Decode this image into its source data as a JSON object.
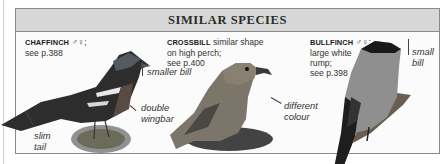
{
  "panel": {
    "title": "SIMILAR SPECIES",
    "species": [
      {
        "name": "CHAFFINCH",
        "sex_symbols": "♂♀;",
        "caption_rest": "see p.388",
        "labels": [
          "smaller bill",
          "double",
          "wingbar",
          "slim",
          "tail"
        ]
      },
      {
        "name": "CROSSBILL",
        "caption_line1": "similar shape",
        "caption_line2": "on high perch;",
        "caption_line3": "see p.400",
        "labels": [
          "different",
          "colour"
        ]
      },
      {
        "name": "BULLFINCH",
        "sex_symbols": "♂♀;",
        "caption_line2": "large white",
        "caption_line3": "rump;",
        "caption_line4": "see p.398",
        "labels": [
          "small",
          "bill"
        ]
      }
    ]
  },
  "colors": {
    "header_bg": "#d7d7d7",
    "border": "#8a8a8a",
    "text": "#333333"
  }
}
